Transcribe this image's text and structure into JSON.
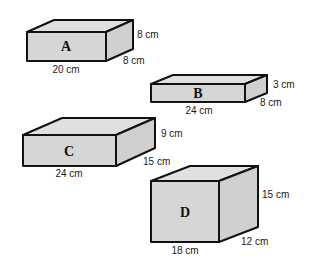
{
  "diagram": {
    "title": "",
    "fill_color": "#d6d6d6",
    "stroke_color": "#111111",
    "boxes": [
      {
        "name": "A",
        "letter": "A",
        "length": "20 cm",
        "height": "8 cm",
        "depth": "8 cm"
      },
      {
        "name": "B",
        "letter": "B",
        "length": "24 cm",
        "height": "3 cm",
        "depth": "8 cm"
      },
      {
        "name": "C",
        "letter": "C",
        "length": "24 cm",
        "height": "9 cm",
        "depth": "15 cm"
      },
      {
        "name": "D",
        "letter": "D",
        "length": "18 cm",
        "height": "15 cm",
        "depth": "12 cm"
      }
    ]
  }
}
